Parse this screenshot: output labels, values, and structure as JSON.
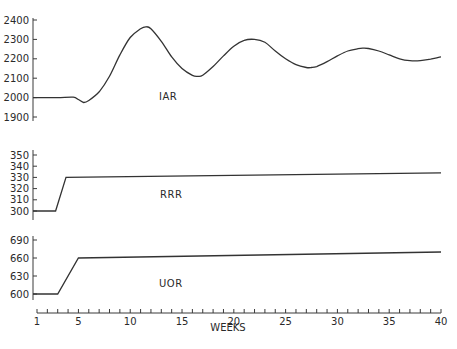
{
  "chart_data": {
    "type": "line",
    "title": "",
    "xlabel": "WEEKS",
    "x_ticks": [
      1,
      5,
      10,
      15,
      20,
      25,
      30,
      35,
      40
    ],
    "xlim": [
      1,
      40
    ],
    "panels": [
      {
        "name": "IAR",
        "ylabel": "",
        "y_ticks": [
          1900,
          2000,
          2100,
          2200,
          2300,
          2400
        ],
        "ylim": [
          1900,
          2400
        ],
        "x": [
          1,
          3,
          4.5,
          5,
          5.5,
          6,
          7,
          8,
          9,
          10,
          11,
          11.5,
          12,
          13,
          14,
          15,
          16,
          16.5,
          17,
          18,
          19,
          20,
          21,
          22,
          23,
          24,
          25,
          26,
          27,
          27.5,
          28,
          29,
          30,
          31,
          32,
          32.5,
          33,
          34,
          35,
          36,
          37,
          38,
          39,
          40
        ],
        "values": [
          2000,
          2000,
          2002,
          1990,
          1975,
          1985,
          2030,
          2110,
          2220,
          2310,
          2355,
          2365,
          2355,
          2290,
          2210,
          2150,
          2115,
          2110,
          2115,
          2160,
          2215,
          2265,
          2295,
          2300,
          2285,
          2240,
          2200,
          2170,
          2155,
          2155,
          2160,
          2185,
          2215,
          2240,
          2252,
          2255,
          2253,
          2240,
          2220,
          2200,
          2190,
          2190,
          2198,
          2210
        ]
      },
      {
        "name": "RRR",
        "ylabel": "",
        "y_ticks": [
          300,
          310,
          320,
          330,
          340,
          350
        ],
        "ylim": [
          300,
          350
        ],
        "x": [
          1,
          2.8,
          3.8,
          40
        ],
        "values": [
          300,
          300,
          330,
          334
        ]
      },
      {
        "name": "UOR",
        "ylabel": "",
        "y_ticks": [
          600,
          630,
          660,
          690
        ],
        "ylim": [
          600,
          690
        ],
        "x": [
          1,
          3,
          5,
          40
        ],
        "values": [
          600,
          600,
          660,
          670
        ]
      }
    ],
    "grid": false,
    "legend": "inline labels"
  },
  "labels": {
    "iar": "IAR",
    "rrr": "RRR",
    "uor": "UOR",
    "xlabel": "WEEKS",
    "iar_ticks": [
      "2400",
      "2300",
      "2200",
      "2100",
      "2000",
      "1900"
    ],
    "rrr_ticks": [
      "350",
      "340",
      "330",
      "320",
      "310",
      "300"
    ],
    "uor_ticks": [
      "690",
      "660",
      "630",
      "600"
    ],
    "x_ticks": [
      "1",
      "5",
      "10",
      "15",
      "20",
      "25",
      "30",
      "35",
      "40"
    ]
  }
}
